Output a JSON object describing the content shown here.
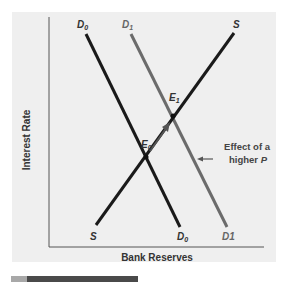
{
  "diagram": {
    "title": "",
    "axes": {
      "y_label": "Interest Rate",
      "x_label": "Bank Reserves"
    },
    "curves": [
      {
        "id": "D0",
        "name": "D",
        "subscript": "0",
        "type": "demand",
        "color": "#1a1a1a",
        "top_label": "D0",
        "bottom_label": "D0"
      },
      {
        "id": "D1",
        "name": "D",
        "subscript": "1",
        "type": "demand",
        "color": "#6b6b6b",
        "top_label": "D1",
        "bottom_label": "D1"
      },
      {
        "id": "S",
        "name": "S",
        "type": "supply",
        "color": "#1a1a1a",
        "top_label": "S",
        "bottom_label": "S"
      }
    ],
    "points": [
      {
        "id": "E0",
        "name": "E",
        "subscript": "0"
      },
      {
        "id": "E1",
        "name": "E",
        "subscript": "1"
      }
    ],
    "annotation": {
      "line1": "Effect of a",
      "line2_prefix": "higher ",
      "line2_var": "P"
    },
    "labels": {
      "d0_top_main": "D",
      "d0_top_sub": "0",
      "d1_top_main": "D",
      "d1_top_sub": "1",
      "s_top": "S",
      "s_bottom": "S",
      "d0_bottom_main": "D",
      "d0_bottom_sub": "0",
      "d1_bottom": "D1",
      "e0_main": "E",
      "e0_sub": "0",
      "e1_main": "E",
      "e1_sub": "1"
    },
    "colors": {
      "panel_bg": "#efefef",
      "axis": "#555555",
      "primary_line": "#1a1a1a",
      "shifted_line": "#6b6b6b",
      "arrow": "#555555"
    }
  }
}
